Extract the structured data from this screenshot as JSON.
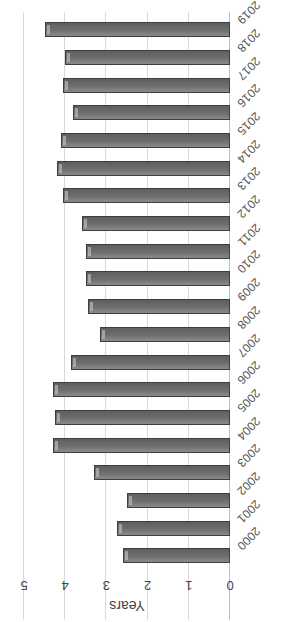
{
  "chart_data": {
    "type": "bar",
    "orientation": "horizontal",
    "rotation_deg": 180,
    "title": "",
    "xlabel": "Years",
    "ylabel": "",
    "xlim": [
      0,
      5
    ],
    "x_ticks": [
      "0",
      "1",
      "2",
      "3",
      "4",
      "5"
    ],
    "grid": true,
    "legend": null,
    "categories": [
      "2000",
      "2001",
      "2002",
      "2003",
      "2004",
      "2005",
      "2006",
      "2007",
      "2008",
      "2009",
      "2010",
      "2011",
      "2012",
      "2013",
      "2014",
      "2015",
      "2016",
      "2017",
      "2018",
      "2019"
    ],
    "values": [
      2.6,
      2.75,
      2.5,
      3.3,
      4.3,
      4.25,
      4.3,
      3.85,
      3.15,
      3.45,
      3.5,
      3.5,
      3.6,
      4.05,
      4.2,
      4.1,
      3.8,
      4.05,
      4.0,
      4.5
    ],
    "bar_color": "#6e6e6e"
  }
}
